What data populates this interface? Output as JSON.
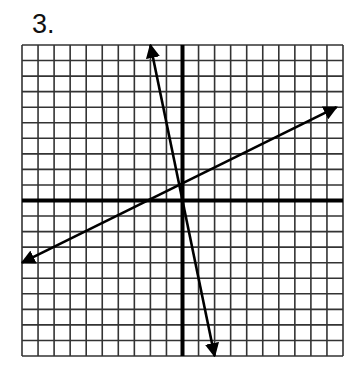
{
  "problem": {
    "number_label": "3."
  },
  "grid": {
    "cells_x": 20,
    "cells_y": 20,
    "x_range": [
      -10,
      10
    ],
    "y_range": [
      -10,
      10
    ],
    "pixel_left": 22,
    "pixel_top": 45,
    "pixel_right": 343,
    "pixel_bottom": 356,
    "grid_color": "#333333",
    "axis_color": "#000000",
    "line_color": "#000000"
  },
  "chart_data": {
    "type": "line",
    "title": "3.",
    "xlabel": "",
    "ylabel": "",
    "xlim": [
      -10,
      10
    ],
    "ylim": [
      -10,
      10
    ],
    "grid": true,
    "axes_through_origin": true,
    "series": [
      {
        "name": "steep line (arrows both ends)",
        "points": [
          [
            -2,
            10
          ],
          [
            2,
            -10
          ]
        ],
        "slope": -5,
        "y_intercept": 0
      },
      {
        "name": "shallow line (arrows both ends)",
        "points": [
          [
            -10,
            -4
          ],
          [
            9.6,
            6
          ]
        ],
        "slope": 0.5,
        "y_intercept": 1
      }
    ]
  }
}
